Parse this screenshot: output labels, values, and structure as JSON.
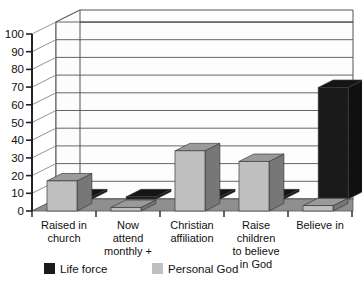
{
  "chart_data": {
    "type": "bar",
    "title": "",
    "subtitle": "",
    "xlabel": "",
    "ylabel": "",
    "ylim": [
      0,
      100
    ],
    "ytick_step": 10,
    "yticks": [
      "0",
      "10",
      "20",
      "30",
      "40",
      "50",
      "60",
      "70",
      "80",
      "90",
      "100"
    ],
    "grid": true,
    "grid_axis": "y",
    "legend_position": "bottom",
    "style": "3d-grouped-depth",
    "categories": [
      "Raised in church",
      "Now attend monthly +",
      "Christian affiliation",
      "Raise children to believe in God",
      "Believe in"
    ],
    "category_label_lines": [
      [
        "Raised in",
        "church"
      ],
      [
        "Now",
        "attend",
        "monthly +"
      ],
      [
        "Christian",
        "affiliation"
      ],
      [
        "Raise",
        "children",
        "to believe",
        "in God"
      ],
      [
        "Believe in"
      ]
    ],
    "series": [
      {
        "name": "Life force",
        "color": "#1a1a1a",
        "values": [
          1,
          1,
          1,
          1,
          63
        ]
      },
      {
        "name": "Personal God",
        "color": "#c0c0c0",
        "values": [
          17,
          2,
          34,
          28,
          3
        ]
      }
    ]
  },
  "legend": {
    "items": [
      {
        "label": "Life force",
        "color": "#1a1a1a",
        "swatch": "legend-swatch-life-force"
      },
      {
        "label": "Personal God",
        "color": "#c0c0c0",
        "swatch": "legend-swatch-personal-god"
      }
    ]
  },
  "axis": {
    "y_tick_0": "0",
    "y_tick_10": "10",
    "y_tick_20": "20",
    "y_tick_30": "30",
    "y_tick_40": "40",
    "y_tick_50": "50",
    "y_tick_60": "60",
    "y_tick_70": "70",
    "y_tick_80": "80",
    "y_tick_90": "90",
    "y_tick_100": "100"
  },
  "colors": {
    "series_life_force": "#1a1a1a",
    "series_personal_god": "#c0c0c0",
    "series_life_force_top": "#3a3a3a",
    "series_life_force_side": "#000000",
    "series_personal_god_top": "#8e8e8e",
    "series_personal_god_side": "#6e6e6e",
    "floor": "#8f8f8f",
    "grid_line": "#555555",
    "axis_line": "#222222",
    "background": "#ffffff",
    "text": "#111111"
  }
}
